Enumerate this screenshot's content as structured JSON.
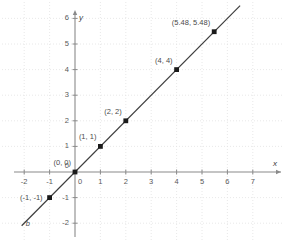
{
  "chart_data": {
    "type": "scatter",
    "title": "",
    "subtitle": "",
    "xlabel": "x",
    "ylabel": "y",
    "xlim": [
      -2.9,
      8.5
    ],
    "ylim": [
      -2.6,
      6.7
    ],
    "xticks": [
      "-2",
      "-1",
      "0",
      "1",
      "2",
      "3",
      "4",
      "5",
      "6",
      "7"
    ],
    "xtick_values": [
      -2,
      -1,
      0,
      1,
      2,
      3,
      4,
      5,
      6,
      7
    ],
    "yticks": [
      "-2",
      "-1",
      "0",
      "1",
      "2",
      "3",
      "4",
      "5",
      "6"
    ],
    "ytick_values": [
      -2,
      -1,
      0,
      1,
      2,
      3,
      4,
      5,
      6
    ],
    "grid": true,
    "grid_style": "dotted",
    "grid_color": "#e2e2e2",
    "axis_color": "#8a8a8a",
    "line_color": "#3d3d3d",
    "marker_color": "#1a1a1a",
    "legend": "none",
    "series": [
      {
        "name": "b",
        "name_label": "b",
        "type": "line",
        "equation": "y = x",
        "slope": 1,
        "intercept": 0,
        "x_start": -2.1,
        "y_start": -2.1,
        "x_end": 6.5,
        "y_end": 6.5
      }
    ],
    "points": [
      {
        "x": -1,
        "y": -1,
        "label": "(-1, -1)",
        "label_pos": "left"
      },
      {
        "x": 0,
        "y": 0,
        "label": "(0, 0)",
        "label_pos": "upper-left"
      },
      {
        "x": 1,
        "y": 1,
        "label": "(1, 1)",
        "label_pos": "upper-left"
      },
      {
        "x": 2,
        "y": 2,
        "label": "(2, 2)",
        "label_pos": "upper-left"
      },
      {
        "x": 4,
        "y": 4,
        "label": "(4, 4)",
        "label_pos": "upper-left"
      },
      {
        "x": 5.48,
        "y": 5.48,
        "label": "(5.48, 5.48)",
        "label_pos": "upper-left"
      }
    ]
  }
}
